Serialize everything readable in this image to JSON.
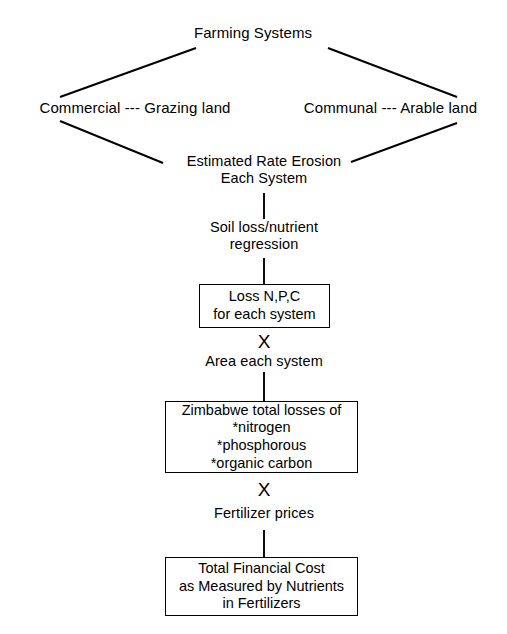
{
  "diagram": {
    "title": "Farming Systems",
    "type": "flowchart",
    "nodes": [
      {
        "id": "farming-systems",
        "name": "farming-systems-node",
        "label": "Farming Systems",
        "style": "plain"
      },
      {
        "id": "commercial-grazing",
        "name": "commercial-grazing-node",
        "label": "Commercial --- Grazing land",
        "style": "plain"
      },
      {
        "id": "communal-arable",
        "name": "communal-arable-node",
        "label": "Communal --- Arable land",
        "style": "plain"
      },
      {
        "id": "estimated-rate-erosion",
        "name": "estimated-rate-erosion-node",
        "label": "Estimated Rate Erosion\nEach System",
        "style": "plain"
      },
      {
        "id": "soil-loss-regression",
        "name": "soil-loss-regression-node",
        "label": "Soil loss/nutrient\nregression",
        "style": "plain"
      },
      {
        "id": "loss-npc",
        "name": "loss-npc-box",
        "label": "Loss N,P,C\nfor each system",
        "style": "boxed"
      },
      {
        "id": "area-each-system",
        "name": "area-each-system-node",
        "label": "Area each system",
        "style": "plain"
      },
      {
        "id": "zimbabwe-total-losses",
        "name": "zimbabwe-total-losses-box",
        "label": "Zimbabwe total losses of\n*nitrogen\n*phosphorous\n*organic carbon",
        "style": "boxed"
      },
      {
        "id": "fertilizer-prices",
        "name": "fertilizer-prices-node",
        "label": "Fertilizer prices",
        "style": "plain"
      },
      {
        "id": "total-financial-cost",
        "name": "total-financial-cost-box",
        "label": "Total Financial Cost\nas Measured by Nutrients\nin Fertilizers",
        "style": "boxed"
      }
    ],
    "operators": [
      {
        "id": "multiply-1",
        "symbol": "X",
        "between": [
          "loss-npc",
          "area-each-system"
        ]
      },
      {
        "id": "multiply-2",
        "symbol": "X",
        "between": [
          "zimbabwe-total-losses",
          "fertilizer-prices"
        ]
      }
    ],
    "colors": {
      "background": "#ffffff",
      "stroke": "#000000",
      "text": "#000000"
    }
  }
}
